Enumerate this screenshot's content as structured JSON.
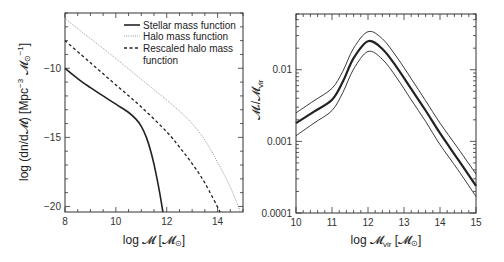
{
  "chart_data": [
    {
      "type": "line",
      "panel": "left",
      "xlabel": "log 𝓜 [𝓜⊙]",
      "ylabel": "log (dn/d𝓜) [Mpc⁻³ 𝓜⊙⁻¹]",
      "xlim": [
        8,
        15
      ],
      "ylim": [
        -20.4,
        -6.0
      ],
      "xticks": [
        8,
        10,
        12,
        14
      ],
      "xtick_labels": [
        "8",
        "10",
        "12",
        "14"
      ],
      "yticks": [
        -10,
        -15,
        -20
      ],
      "ytick_labels": [
        "−10",
        "−15",
        "−20"
      ],
      "grid": false,
      "legend_position": "upper right",
      "series": [
        {
          "name": "Stellar mass function",
          "style": "solid",
          "color": "#222222",
          "x": [
            8,
            8.5,
            9,
            9.5,
            10,
            10.5,
            10.8,
            11,
            11.2,
            11.4,
            11.6,
            11.75,
            11.85
          ],
          "y": [
            -10.0,
            -10.75,
            -11.4,
            -12.0,
            -12.6,
            -13.2,
            -13.7,
            -14.2,
            -15.0,
            -16.2,
            -17.8,
            -19.3,
            -20.4
          ]
        },
        {
          "name": "Halo mass function",
          "style": "dotted",
          "color": "#999999",
          "x": [
            8,
            9,
            10,
            11,
            12,
            12.5,
            13,
            13.5,
            14,
            14.5,
            14.9
          ],
          "y": [
            -6.4,
            -7.85,
            -9.3,
            -10.8,
            -12.3,
            -13.1,
            -14.0,
            -15.2,
            -16.8,
            -18.6,
            -20.4
          ]
        },
        {
          "name": "Rescaled halo mass function",
          "style": "dashed",
          "color": "#222222",
          "x": [
            8,
            9,
            10,
            11,
            12,
            12.5,
            13,
            13.5,
            14.1
          ],
          "y": [
            -8.0,
            -9.6,
            -11.2,
            -12.8,
            -14.6,
            -15.7,
            -16.9,
            -18.3,
            -20.4
          ]
        }
      ]
    },
    {
      "type": "line",
      "panel": "right",
      "xlabel": "log 𝓜vir [𝓜⊙]",
      "ylabel": "𝓜*/𝓜vir",
      "xlim": [
        10,
        15
      ],
      "ylim": [
        0.0001,
        0.06
      ],
      "yscale": "log",
      "xticks": [
        10,
        11,
        12,
        13,
        14,
        15
      ],
      "xtick_labels": [
        "10",
        "11",
        "12",
        "13",
        "14",
        "15"
      ],
      "yticks": [
        0.0001,
        0.001,
        0.01
      ],
      "ytick_labels": [
        "0.0001",
        "0.001",
        "0.01"
      ],
      "grid": false,
      "series": [
        {
          "name": "upper bound",
          "style": "thin",
          "x": [
            10,
            10.5,
            11,
            11.3,
            11.6,
            12,
            12.4,
            12.8,
            13.2,
            13.6,
            14,
            14.5,
            15
          ],
          "y": [
            0.0025,
            0.0037,
            0.0055,
            0.0095,
            0.02,
            0.034,
            0.027,
            0.015,
            0.0075,
            0.0037,
            0.0018,
            0.0008,
            0.00035
          ]
        },
        {
          "name": "central relation",
          "style": "thick",
          "x": [
            10,
            10.5,
            11,
            11.3,
            11.6,
            12,
            12.4,
            12.8,
            13.2,
            13.6,
            14,
            14.5,
            15
          ],
          "y": [
            0.0018,
            0.0026,
            0.0038,
            0.0068,
            0.0145,
            0.025,
            0.0195,
            0.0108,
            0.0054,
            0.0027,
            0.0013,
            0.00056,
            0.00024
          ]
        },
        {
          "name": "lower bound",
          "style": "thin",
          "x": [
            10,
            10.5,
            11,
            11.3,
            11.6,
            12,
            12.4,
            12.8,
            13.2,
            13.6,
            14,
            14.5,
            15
          ],
          "y": [
            0.0012,
            0.0018,
            0.0027,
            0.0048,
            0.0102,
            0.018,
            0.014,
            0.0077,
            0.0038,
            0.0019,
            0.0009,
            0.0004,
            0.00017
          ]
        }
      ]
    }
  ],
  "left": {
    "xlabel_main": "log 𝓜 [𝓜",
    "xlabel_sub": "⊙",
    "xlabel_close": "]",
    "ylabel": "log (dn/d𝓜) [Mpc",
    "ylabel_sup": "−3",
    "ylabel_mid": " 𝓜",
    "ylabel_sub": "⊙",
    "ylabel_sup2": "−1",
    "ylabel_close": "]",
    "legend": [
      "Stellar mass function",
      "Halo mass function",
      "Rescaled halo mass",
      "function"
    ]
  },
  "right": {
    "xlabel_main": "log 𝓜",
    "xlabel_sub": "vir",
    "xlabel_mid": " [𝓜",
    "xlabel_sub2": "⊙",
    "xlabel_close": "]",
    "ylabel_main": "𝓜",
    "ylabel_sub": "*",
    "ylabel_mid": "/𝓜",
    "ylabel_sub2": "vir"
  }
}
